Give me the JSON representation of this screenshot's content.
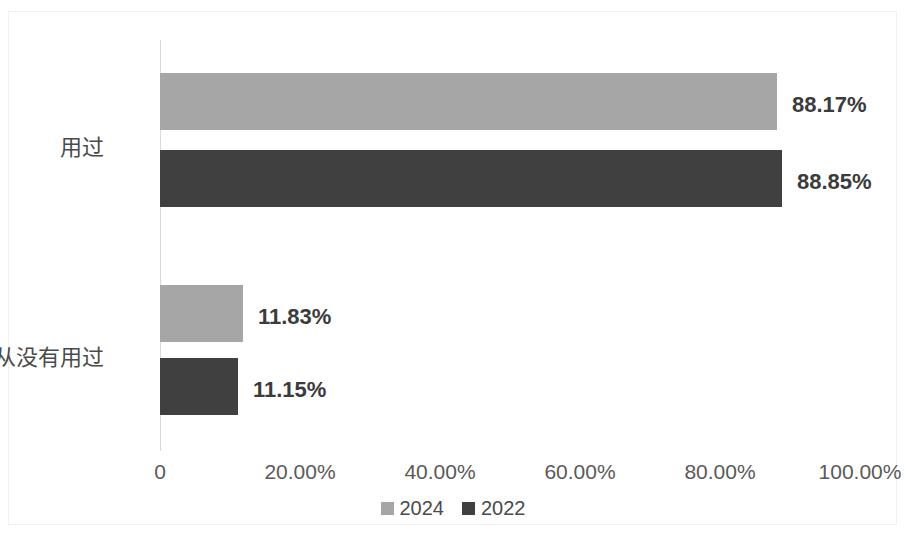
{
  "chart_data": {
    "type": "bar",
    "orientation": "horizontal",
    "title": "",
    "subtitle": "",
    "xlabel": "",
    "ylabel": "",
    "categories": [
      "用过",
      "我从没有用过"
    ],
    "series": [
      {
        "name": "2024",
        "color": "#a6a6a6",
        "values": [
          88.17,
          11.83
        ],
        "labels": [
          "88.17%",
          "11.83%"
        ]
      },
      {
        "name": "2022",
        "color": "#404040",
        "values": [
          88.85,
          11.15
        ],
        "labels": [
          "88.85%",
          "11.15%"
        ]
      }
    ],
    "xlim": [
      0,
      100
    ],
    "axis_ticks": [
      {
        "value": 0,
        "label": "0"
      },
      {
        "value": 20,
        "label": "20.00%"
      },
      {
        "value": 40,
        "label": "40.00%"
      },
      {
        "value": 60,
        "label": "60.00%"
      },
      {
        "value": 80,
        "label": "80.00%"
      },
      {
        "value": 100,
        "label": "100.00%"
      }
    ],
    "grid": false,
    "legend_position": "bottom",
    "axis_line_color": "#d9d9d9",
    "data_label_color": "#3b3b3b",
    "background_color": "#ffffff"
  },
  "legend": {
    "items": [
      {
        "label": "2024",
        "color": "#a6a6a6"
      },
      {
        "label": "2022",
        "color": "#404040"
      }
    ]
  }
}
